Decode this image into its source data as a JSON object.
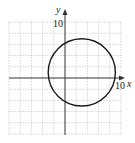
{
  "chart_data": {
    "type": "line",
    "title": "",
    "xlabel": "x",
    "ylabel": "y",
    "xlim": [
      -10,
      10
    ],
    "ylim": [
      -10,
      10
    ],
    "x_tick_label": "10",
    "y_tick_label": "10",
    "grid": true,
    "grid_step": 2,
    "series": [
      {
        "name": "circle",
        "shape": "circle",
        "center": [
          3,
          1
        ],
        "radius": 6,
        "equation": "(x-3)^2 + (y-1)^2 = 36"
      }
    ]
  },
  "labels": {
    "x_axis": "x",
    "y_axis": "y",
    "x_max": "10",
    "y_max": "10"
  },
  "colors": {
    "curve": "#1a1a1a",
    "axis": "#333333",
    "grid": "#b8b8b8"
  }
}
